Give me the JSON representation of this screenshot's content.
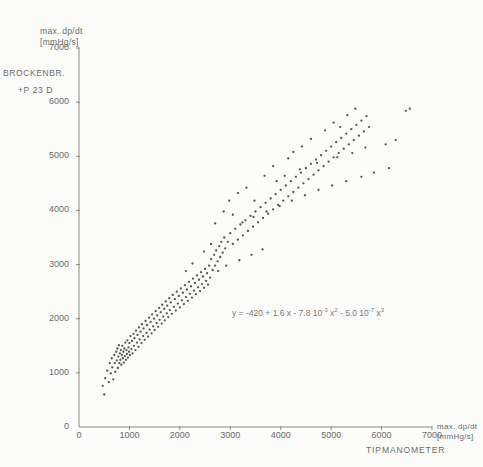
{
  "figure": {
    "series_label_line1": "BROCKENBR.",
    "series_label_line2": "+P 23 D",
    "equation_text": "y = -420 + 1.6 x - 7.8 10   x   - 5.0 10   x"
  },
  "axes": {
    "y_title_line1": "max. dp/dt",
    "y_title_line2": "[mmHg/s]",
    "x_title_line1": "max. dp/dt",
    "x_title_line2": "[mmHg/s]",
    "x_device_label": "TIPMANOMETER",
    "y_ticks": [
      "0",
      "1000",
      "2000",
      "3000",
      "4000",
      "5000",
      "6000",
      "7000"
    ],
    "x_ticks": [
      "0",
      "1000",
      "2000",
      "3000",
      "4000",
      "5000",
      "6000",
      "7000"
    ]
  },
  "equation_parts": {
    "lead": "y = -420 + 1.6 x - 7.8 10",
    "exp1": "-3",
    "mid1": " x",
    "exp2": "2",
    "mid2": " - 5.0 10",
    "exp3": "-7",
    "mid3": " x",
    "exp4": "3"
  },
  "colors": {
    "background": "#fbfbf9",
    "axis": "#8a8a8a",
    "text": "#6b6b6b",
    "marker": "#555555",
    "curve": "#9a9a9a"
  },
  "chart_data": {
    "type": "scatter",
    "title": "",
    "xlabel": "max. dp/dt [mmHg/s] TIPMANOMETER",
    "ylabel": "max. dp/dt [mmHg/s]",
    "xlim": [
      0,
      7000
    ],
    "ylim": [
      0,
      7000
    ],
    "grid": false,
    "legend": "none",
    "annotation": "y = -420 + 1.6x - 7.8·10^-3 x^2 - 5.0·10^-7 x^3",
    "fit": {
      "kind": "cubic",
      "intercept": -420,
      "b1": 1.6,
      "b2": -0.0078,
      "b3": -5e-07,
      "x_from": 700,
      "x_to": 6250
    },
    "series": [
      {
        "name": "BROCKENBR. +P 23 D",
        "marker": "dot",
        "points": [
          [
            470,
            760
          ],
          [
            500,
            600
          ],
          [
            520,
            900
          ],
          [
            560,
            1040
          ],
          [
            590,
            830
          ],
          [
            610,
            1180
          ],
          [
            630,
            990
          ],
          [
            650,
            1270
          ],
          [
            660,
            1100
          ],
          [
            680,
            880
          ],
          [
            700,
            1330
          ],
          [
            710,
            1180
          ],
          [
            720,
            1020
          ],
          [
            740,
            1390
          ],
          [
            750,
            1230
          ],
          [
            760,
            1450
          ],
          [
            770,
            1090
          ],
          [
            780,
            1300
          ],
          [
            790,
            1510
          ],
          [
            800,
            1180
          ],
          [
            810,
            1360
          ],
          [
            820,
            1240
          ],
          [
            830,
            1420
          ],
          [
            840,
            1150
          ],
          [
            850,
            1330
          ],
          [
            860,
            1500
          ],
          [
            870,
            1270
          ],
          [
            880,
            1390
          ],
          [
            890,
            1190
          ],
          [
            900,
            1450
          ],
          [
            910,
            1310
          ],
          [
            920,
            1560
          ],
          [
            930,
            1240
          ],
          [
            940,
            1420
          ],
          [
            950,
            1350
          ],
          [
            960,
            1600
          ],
          [
            970,
            1280
          ],
          [
            980,
            1470
          ],
          [
            990,
            1390
          ],
          [
            1000,
            1550
          ],
          [
            1010,
            1330
          ],
          [
            1020,
            1680
          ],
          [
            1040,
            1440
          ],
          [
            1050,
            1590
          ],
          [
            1060,
            1360
          ],
          [
            1080,
            1720
          ],
          [
            1090,
            1500
          ],
          [
            1100,
            1640
          ],
          [
            1120,
            1420
          ],
          [
            1130,
            1780
          ],
          [
            1150,
            1560
          ],
          [
            1160,
            1700
          ],
          [
            1180,
            1480
          ],
          [
            1190,
            1840
          ],
          [
            1200,
            1620
          ],
          [
            1220,
            1760
          ],
          [
            1240,
            1550
          ],
          [
            1250,
            1900
          ],
          [
            1270,
            1680
          ],
          [
            1280,
            1820
          ],
          [
            1300,
            1610
          ],
          [
            1320,
            1960
          ],
          [
            1340,
            1740
          ],
          [
            1350,
            1880
          ],
          [
            1370,
            1670
          ],
          [
            1390,
            2020
          ],
          [
            1400,
            1800
          ],
          [
            1420,
            1940
          ],
          [
            1440,
            1730
          ],
          [
            1450,
            2080
          ],
          [
            1470,
            1860
          ],
          [
            1490,
            2000
          ],
          [
            1500,
            1790
          ],
          [
            1520,
            2140
          ],
          [
            1540,
            1920
          ],
          [
            1550,
            2060
          ],
          [
            1570,
            1850
          ],
          [
            1590,
            2200
          ],
          [
            1600,
            1980
          ],
          [
            1620,
            2120
          ],
          [
            1640,
            1910
          ],
          [
            1650,
            2260
          ],
          [
            1670,
            2040
          ],
          [
            1690,
            2180
          ],
          [
            1700,
            1970
          ],
          [
            1720,
            2320
          ],
          [
            1740,
            2100
          ],
          [
            1750,
            2240
          ],
          [
            1770,
            2030
          ],
          [
            1790,
            2380
          ],
          [
            1800,
            2160
          ],
          [
            1820,
            2300
          ],
          [
            1840,
            2090
          ],
          [
            1860,
            2440
          ],
          [
            1880,
            2220
          ],
          [
            1900,
            2360
          ],
          [
            1920,
            2150
          ],
          [
            1940,
            2500
          ],
          [
            1960,
            2280
          ],
          [
            1980,
            2420
          ],
          [
            2000,
            2210
          ],
          [
            2020,
            2560
          ],
          [
            2040,
            2340
          ],
          [
            2060,
            2480
          ],
          [
            2080,
            2270
          ],
          [
            2100,
            2620
          ],
          [
            2120,
            2400
          ],
          [
            2140,
            2540
          ],
          [
            2160,
            2330
          ],
          [
            2180,
            2680
          ],
          [
            2200,
            2460
          ],
          [
            2220,
            2600
          ],
          [
            2240,
            2390
          ],
          [
            2260,
            2740
          ],
          [
            2280,
            2520
          ],
          [
            2300,
            2660
          ],
          [
            2320,
            2450
          ],
          [
            2340,
            2800
          ],
          [
            2360,
            2580
          ],
          [
            2380,
            2720
          ],
          [
            2400,
            2510
          ],
          [
            2420,
            2860
          ],
          [
            2440,
            2640
          ],
          [
            2460,
            2780
          ],
          [
            2480,
            2570
          ],
          [
            2500,
            2920
          ],
          [
            2520,
            2700
          ],
          [
            2540,
            2840
          ],
          [
            2560,
            2630
          ],
          [
            2580,
            2980
          ],
          [
            2600,
            2760
          ],
          [
            2620,
            3100
          ],
          [
            2650,
            2900
          ],
          [
            2680,
            3180
          ],
          [
            2700,
            2980
          ],
          [
            2720,
            3260
          ],
          [
            2750,
            3060
          ],
          [
            2780,
            3340
          ],
          [
            2800,
            3140
          ],
          [
            2820,
            3420
          ],
          [
            2850,
            3220
          ],
          [
            2880,
            3500
          ],
          [
            2900,
            3300
          ],
          [
            2950,
            3420
          ],
          [
            3000,
            3580
          ],
          [
            3050,
            3380
          ],
          [
            3100,
            3660
          ],
          [
            3150,
            3460
          ],
          [
            3200,
            3740
          ],
          [
            3250,
            3540
          ],
          [
            3300,
            3820
          ],
          [
            3350,
            3620
          ],
          [
            3400,
            3900
          ],
          [
            3450,
            3700
          ],
          [
            3500,
            3980
          ],
          [
            3550,
            3780
          ],
          [
            3600,
            4060
          ],
          [
            3650,
            3860
          ],
          [
            3700,
            4140
          ],
          [
            3750,
            3940
          ],
          [
            3800,
            4220
          ],
          [
            3850,
            4020
          ],
          [
            3900,
            4300
          ],
          [
            3950,
            4100
          ],
          [
            4000,
            4380
          ],
          [
            4050,
            4180
          ],
          [
            4100,
            4460
          ],
          [
            4150,
            4260
          ],
          [
            4200,
            4540
          ],
          [
            4250,
            4340
          ],
          [
            4300,
            4620
          ],
          [
            4350,
            4420
          ],
          [
            4400,
            4700
          ],
          [
            4450,
            4500
          ],
          [
            4500,
            4780
          ],
          [
            4550,
            4580
          ],
          [
            4600,
            4860
          ],
          [
            4650,
            4660
          ],
          [
            4700,
            4940
          ],
          [
            4750,
            4740
          ],
          [
            4800,
            5020
          ],
          [
            4850,
            4820
          ],
          [
            4900,
            5100
          ],
          [
            4950,
            4900
          ],
          [
            5000,
            5180
          ],
          [
            5050,
            4980
          ],
          [
            5100,
            5260
          ],
          [
            5150,
            5060
          ],
          [
            5200,
            5340
          ],
          [
            5250,
            5140
          ],
          [
            5300,
            5420
          ],
          [
            5350,
            5220
          ],
          [
            5400,
            5500
          ],
          [
            5450,
            5300
          ],
          [
            5500,
            5580
          ],
          [
            5550,
            5380
          ],
          [
            5600,
            5660
          ],
          [
            5650,
            5460
          ],
          [
            5700,
            5740
          ],
          [
            5750,
            5540
          ],
          [
            2980,
            4180
          ],
          [
            3150,
            4320
          ],
          [
            3320,
            4420
          ],
          [
            2870,
            3980
          ],
          [
            3480,
            4180
          ],
          [
            2700,
            3760
          ],
          [
            3050,
            3920
          ],
          [
            4250,
            5080
          ],
          [
            4420,
            5180
          ],
          [
            4600,
            5320
          ],
          [
            4150,
            4960
          ],
          [
            3850,
            4820
          ],
          [
            3680,
            4640
          ],
          [
            5050,
            5620
          ],
          [
            5320,
            5760
          ],
          [
            5480,
            5880
          ],
          [
            5180,
            5540
          ],
          [
            4880,
            5480
          ],
          [
            2480,
            3240
          ],
          [
            2620,
            3380
          ],
          [
            2250,
            3020
          ],
          [
            2120,
            2880
          ],
          [
            3920,
            4540
          ],
          [
            4080,
            4640
          ],
          [
            4380,
            4760
          ],
          [
            4720,
            4880
          ],
          [
            5120,
            4980
          ],
          [
            5420,
            5060
          ],
          [
            5680,
            5160
          ],
          [
            6080,
            5220
          ],
          [
            6280,
            5300
          ],
          [
            6480,
            5840
          ],
          [
            6560,
            5880
          ],
          [
            6150,
            4780
          ],
          [
            5850,
            4700
          ],
          [
            5600,
            4620
          ],
          [
            5300,
            4540
          ],
          [
            5020,
            4460
          ],
          [
            4750,
            4380
          ],
          [
            4480,
            4280
          ],
          [
            4220,
            4180
          ],
          [
            3980,
            4080
          ],
          [
            3720,
            3980
          ],
          [
            3460,
            3880
          ],
          [
            3240,
            3780
          ],
          [
            2920,
            2980
          ],
          [
            3180,
            3080
          ],
          [
            3420,
            3180
          ],
          [
            3640,
            3280
          ],
          [
            2760,
            2880
          ]
        ]
      }
    ]
  }
}
